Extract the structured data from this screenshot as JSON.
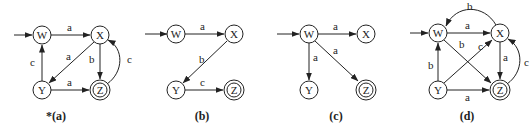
{
  "diagrams": [
    {
      "caption": "*(a)",
      "nodes": {
        "W": "W",
        "X": "X",
        "Y": "Y",
        "Z": "Z"
      },
      "accepting": "Z",
      "start": "W",
      "edges": [
        {
          "from": "W",
          "to": "X",
          "label": "a"
        },
        {
          "from": "X",
          "to": "Y",
          "label": "a"
        },
        {
          "from": "X",
          "to": "Z",
          "label": "b"
        },
        {
          "from": "Y",
          "to": "W",
          "label": "c"
        },
        {
          "from": "Y",
          "to": "Z",
          "label": "a"
        },
        {
          "from": "Z",
          "to": "X",
          "label": "c"
        }
      ]
    },
    {
      "caption": "(b)",
      "nodes": {
        "W": "W",
        "X": "X",
        "Y": "Y",
        "Z": "Z"
      },
      "accepting": "Z",
      "start": "W",
      "edges": [
        {
          "from": "W",
          "to": "X",
          "label": "a"
        },
        {
          "from": "X",
          "to": "Y",
          "label": "b"
        },
        {
          "from": "Y",
          "to": "Z",
          "label": "c"
        }
      ]
    },
    {
      "caption": "(c)",
      "nodes": {
        "W": "W",
        "X": "X",
        "Y": "Y",
        "Z": "Z"
      },
      "accepting": "Z",
      "start": "W",
      "edges": [
        {
          "from": "W",
          "to": "X",
          "label": "a"
        },
        {
          "from": "W",
          "to": "Y",
          "label": "a"
        },
        {
          "from": "W",
          "to": "Z",
          "label": "a"
        }
      ]
    },
    {
      "caption": "(d)",
      "nodes": {
        "W": "W",
        "X": "X",
        "Y": "Y",
        "Z": "Z"
      },
      "accepting": "Z",
      "start": "W",
      "edges": [
        {
          "from": "W",
          "to": "X",
          "label": "a"
        },
        {
          "from": "X",
          "to": "W",
          "label": "b"
        },
        {
          "from": "W",
          "to": "Z",
          "label": "b"
        },
        {
          "from": "Y",
          "to": "X",
          "label": "c"
        },
        {
          "from": "X",
          "to": "Z",
          "label": "a"
        },
        {
          "from": "Y",
          "to": "W",
          "label": "b"
        },
        {
          "from": "Y",
          "to": "Z",
          "label": "a"
        },
        {
          "from": "Z",
          "to": "X",
          "label": "c"
        }
      ]
    }
  ]
}
